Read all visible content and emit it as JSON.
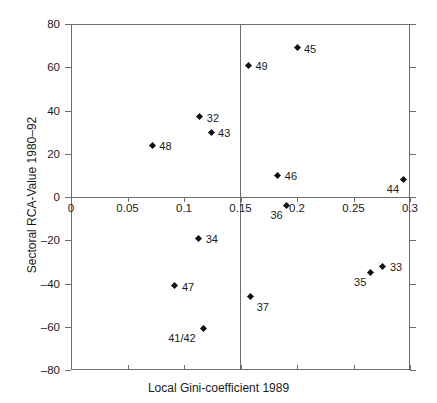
{
  "chart_data": {
    "type": "scatter",
    "title": "",
    "xlabel": "Local Gini-coefficient 1989",
    "ylabel": "Sectoral RCA-Value 1980–92",
    "xlim": [
      0,
      0.3
    ],
    "ylim": [
      -80,
      80
    ],
    "xticks": [
      "0",
      "0.05",
      "0.1",
      "0.15",
      "0.2",
      "0.25",
      "0.3"
    ],
    "xtick_values": [
      0,
      0.05,
      0.1,
      0.15,
      0.2,
      0.25,
      0.3
    ],
    "yticks": [
      "80",
      "60",
      "40",
      "20",
      "0",
      "–20",
      "–40",
      "–60",
      "–80"
    ],
    "ytick_values": [
      80,
      60,
      40,
      20,
      0,
      -20,
      -40,
      -60,
      -80
    ],
    "grid": false,
    "legend": "none",
    "reference_lines": [
      {
        "axis": "x",
        "value": 0.15
      },
      {
        "axis": "y",
        "value": 0
      }
    ],
    "marker_shape": "diamond",
    "marker_color": "#111111",
    "axis_color": "#6e6e6e",
    "points": [
      {
        "label": "48",
        "x": 0.072,
        "y": 24,
        "label_pos": "right"
      },
      {
        "label": "32",
        "x": 0.114,
        "y": 37,
        "label_pos": "right"
      },
      {
        "label": "43",
        "x": 0.124,
        "y": 30,
        "label_pos": "right"
      },
      {
        "label": "49",
        "x": 0.157,
        "y": 61,
        "label_pos": "right"
      },
      {
        "label": "45",
        "x": 0.2,
        "y": 69,
        "label_pos": "right"
      },
      {
        "label": "46",
        "x": 0.183,
        "y": 10,
        "label_pos": "right"
      },
      {
        "label": "44",
        "x": 0.294,
        "y": 8,
        "label_pos": "below-left"
      },
      {
        "label": "36",
        "x": 0.191,
        "y": -4,
        "label_pos": "below-left"
      },
      {
        "label": "34",
        "x": 0.113,
        "y": -19,
        "label_pos": "right"
      },
      {
        "label": "47",
        "x": 0.092,
        "y": -41,
        "label_pos": "right"
      },
      {
        "label": "41/42",
        "x": 0.117,
        "y": -61,
        "label_pos": "below-left"
      },
      {
        "label": "37",
        "x": 0.159,
        "y": -46,
        "label_pos": "below-right"
      },
      {
        "label": "35",
        "x": 0.265,
        "y": -35,
        "label_pos": "below-left"
      },
      {
        "label": "33",
        "x": 0.276,
        "y": -32,
        "label_pos": "right"
      }
    ]
  }
}
